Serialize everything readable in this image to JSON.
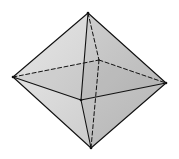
{
  "diagram": {
    "type": "octahedron",
    "vertices": {
      "top": [
        88,
        13
      ],
      "left": [
        13,
        77
      ],
      "right": [
        166,
        83
      ],
      "bottom": [
        91,
        148
      ],
      "front": [
        81,
        100
      ],
      "back": [
        99,
        60
      ]
    },
    "colors": {
      "background": "#ffffff",
      "edge": "#111111",
      "face_upper_left": "#dedede",
      "face_upper_right": "#c2c2c2",
      "face_lower_left": "#d9d9d9",
      "face_lower_right": "#bdbdbd",
      "inner_shade": "#c9c9c9"
    },
    "solid_edges": [
      [
        "top",
        "left"
      ],
      [
        "top",
        "right"
      ],
      [
        "top",
        "front"
      ],
      [
        "bottom",
        "left"
      ],
      [
        "bottom",
        "right"
      ],
      [
        "bottom",
        "front"
      ],
      [
        "left",
        "front"
      ],
      [
        "front",
        "right"
      ]
    ],
    "hidden_edges": [
      [
        "top",
        "back"
      ],
      [
        "bottom",
        "back"
      ],
      [
        "left",
        "back"
      ],
      [
        "back",
        "right"
      ]
    ]
  }
}
